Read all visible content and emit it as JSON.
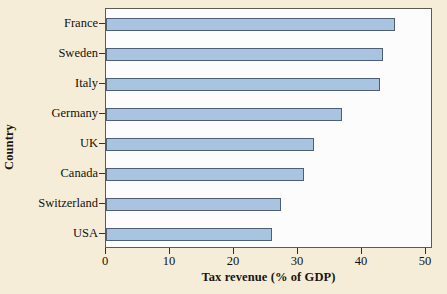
{
  "chart_data": {
    "type": "bar",
    "orientation": "horizontal",
    "title": "",
    "xlabel": "Tax revenue (% of GDP)",
    "ylabel": "Country",
    "categories": [
      "France",
      "Sweden",
      "Italy",
      "Germany",
      "UK",
      "Canada",
      "Switzerland",
      "USA"
    ],
    "values": [
      45.2,
      43.3,
      42.8,
      36.9,
      32.5,
      30.9,
      27.3,
      25.9
    ],
    "xlim": [
      0,
      50
    ],
    "xticks": [
      0,
      10,
      20,
      30,
      40,
      50
    ],
    "xtick_labels": [
      "0",
      "10",
      "20",
      "30",
      "40",
      "50"
    ],
    "grid": false,
    "legend": null,
    "bar_color": "#a8c4e0",
    "bar_edge_color": "#4e5f75",
    "plot_background": "#fcfcfc",
    "figure_background": "#f5edd8",
    "axis_color": "#5c5a53"
  }
}
